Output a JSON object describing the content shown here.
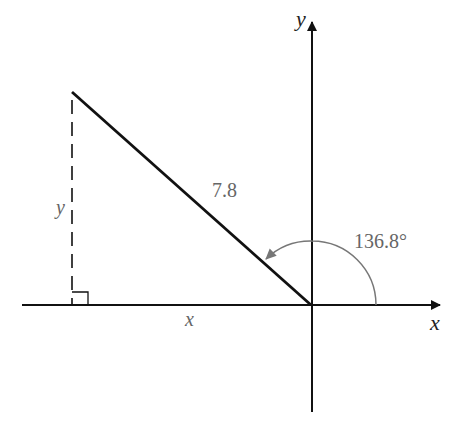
{
  "diagram": {
    "axes": {
      "x_label": "x",
      "y_label": "y"
    },
    "hypotenuse_label": "7.8",
    "angle_label": "136.8°",
    "leg_labels": {
      "horizontal": "x",
      "vertical": "y"
    },
    "colors": {
      "line": "#111111",
      "arc": "#777777",
      "text": "#666666"
    }
  }
}
